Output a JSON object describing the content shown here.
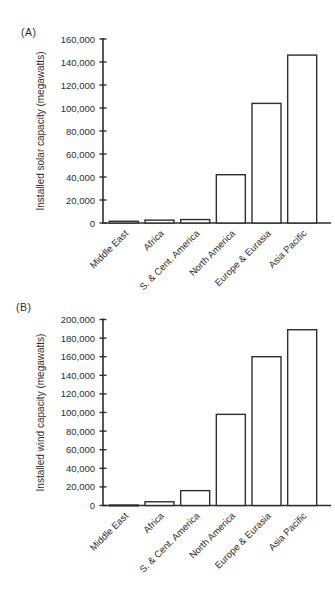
{
  "colors": {
    "ink": "#2e2e2e",
    "background": "#ffffff"
  },
  "chart_data": [
    {
      "type": "bar",
      "panel": "(A)",
      "title": "",
      "xlabel": "",
      "ylabel": "Installed solar capacity (megawatts)",
      "categories": [
        "Middle East",
        "Africa",
        "S. & Cent. America",
        "North America",
        "Europe & Eurasia",
        "Asia Pacific"
      ],
      "values": [
        1500,
        2500,
        3000,
        42000,
        104000,
        146000
      ],
      "ylim": [
        0,
        160000
      ],
      "ytick_step": 20000,
      "ytick_labels": [
        "0",
        "20,000",
        "40,000",
        "60,000",
        "80,000",
        "100,000",
        "120,000",
        "140,000",
        "160,000"
      ],
      "bar_fill": "#ffffff",
      "bar_stroke": "#2e2e2e",
      "grid": false,
      "legend": false
    },
    {
      "type": "bar",
      "panel": "(B)",
      "title": "",
      "xlabel": "",
      "ylabel": "Installed wind capacity (megawatts)",
      "categories": [
        "Middle East",
        "Africa",
        "S. & Cent. America",
        "North America",
        "Europe & Eurasia",
        "Asia Pacific"
      ],
      "values": [
        500,
        4000,
        16000,
        98000,
        160000,
        189000
      ],
      "ylim": [
        0,
        200000
      ],
      "ytick_step": 20000,
      "ytick_labels": [
        "0",
        "20,000",
        "40,000",
        "60,000",
        "80,000",
        "100,000",
        "120,000",
        "140,000",
        "160,000",
        "180,000",
        "200,000"
      ],
      "bar_fill": "#ffffff",
      "bar_stroke": "#2e2e2e",
      "grid": false,
      "legend": false
    }
  ]
}
